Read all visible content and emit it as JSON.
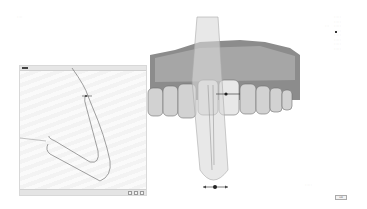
{
  "window": {
    "title": "····"
  },
  "panel_2d": {
    "name": "cross-section view",
    "toolbar_buttons": [
      "·",
      "·",
      "·"
    ]
  },
  "viewport_3d": {
    "subject": "dental arch scan with sectioning plane",
    "plane_handle": "move handle"
  },
  "right_menu": {
    "side_labels": [
      "···",
      "·",
      "··"
    ],
    "items": [
      "·····",
      "·····",
      "·····",
      "·····",
      "·····",
      "·····",
      "·····",
      "·····",
      "·····",
      "·····"
    ]
  },
  "footer": {
    "hint": "·····",
    "ok_label": "OK"
  },
  "colors": {
    "background": "#ffffff",
    "model": "#9a9a9a",
    "plane": "#d8d8d8"
  }
}
